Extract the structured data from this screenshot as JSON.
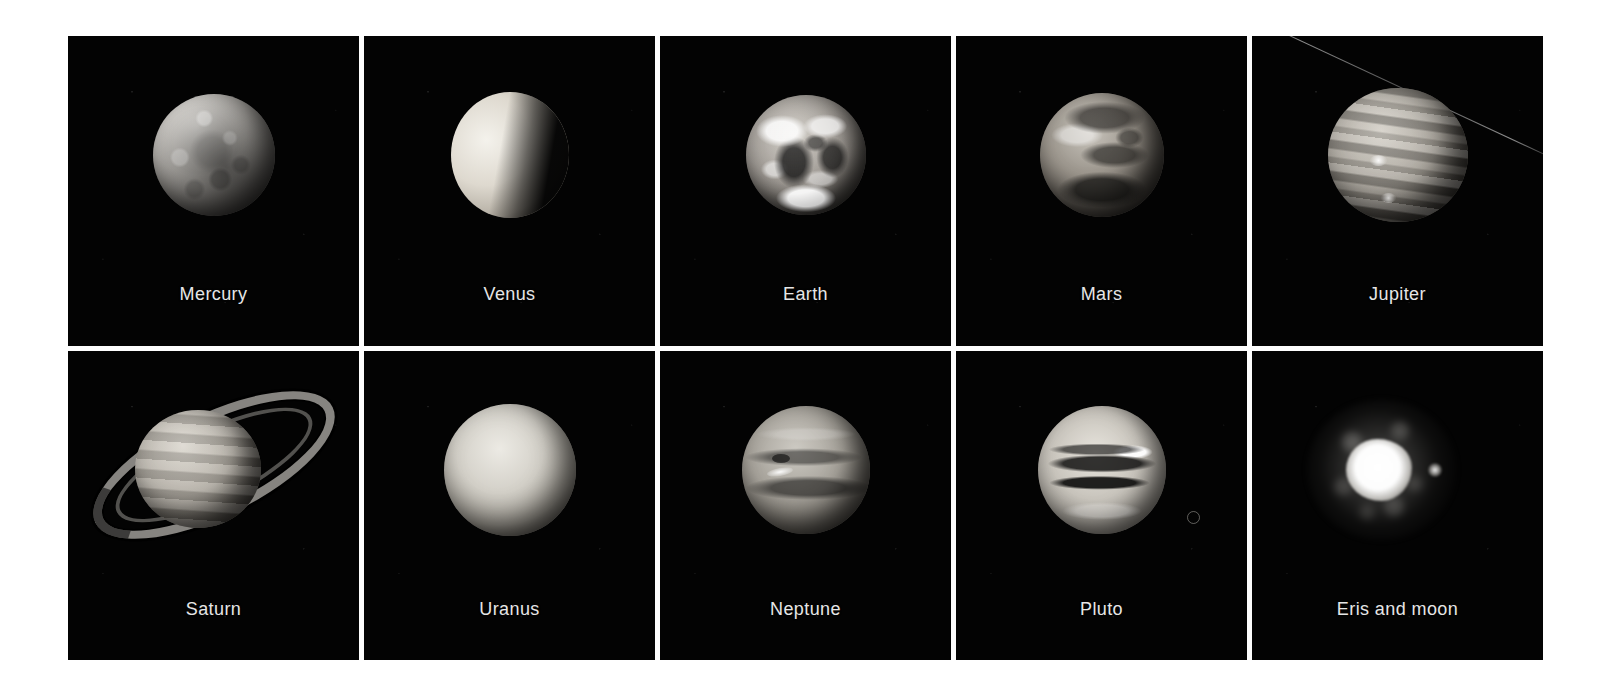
{
  "figure": {
    "background_color": "#ffffff",
    "plate_color": "#030303",
    "label_color": "#e6e6e6",
    "columns": 5,
    "rows": 2
  },
  "cells": [
    {
      "label": "Mercury",
      "body": "mercury",
      "caption_position": "bottom-center"
    },
    {
      "label": "Venus",
      "body": "venus",
      "caption_position": "bottom-center"
    },
    {
      "label": "Earth",
      "body": "earth",
      "caption_position": "bottom-center"
    },
    {
      "label": "Mars",
      "body": "mars",
      "caption_position": "bottom-center"
    },
    {
      "label": "Jupiter",
      "body": "jupiter",
      "caption_position": "bottom-center"
    },
    {
      "label": "Saturn",
      "body": "saturn",
      "caption_position": "bottom-center"
    },
    {
      "label": "Uranus",
      "body": "uranus",
      "caption_position": "bottom-center"
    },
    {
      "label": "Neptune",
      "body": "neptune",
      "caption_position": "bottom-center"
    },
    {
      "label": "Pluto",
      "body": "pluto",
      "caption_position": "bottom-center"
    },
    {
      "label": "Eris and moon",
      "body": "eris",
      "caption_position": "bottom-center"
    }
  ]
}
